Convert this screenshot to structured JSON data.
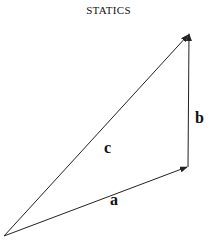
{
  "header": {
    "title": "STATICS"
  },
  "diagram": {
    "type": "vector-triangle",
    "colors": {
      "line": "#222222",
      "background": "#ffffff"
    },
    "vectors": [
      {
        "name": "a",
        "label": "a",
        "from": [
          4,
          236
        ],
        "to": [
          187,
          167
        ]
      },
      {
        "name": "b",
        "label": "b",
        "from": [
          188,
          167
        ],
        "to": [
          189,
          34
        ]
      },
      {
        "name": "c",
        "label": "c",
        "from": [
          4,
          236
        ],
        "to": [
          188,
          35
        ]
      }
    ]
  }
}
